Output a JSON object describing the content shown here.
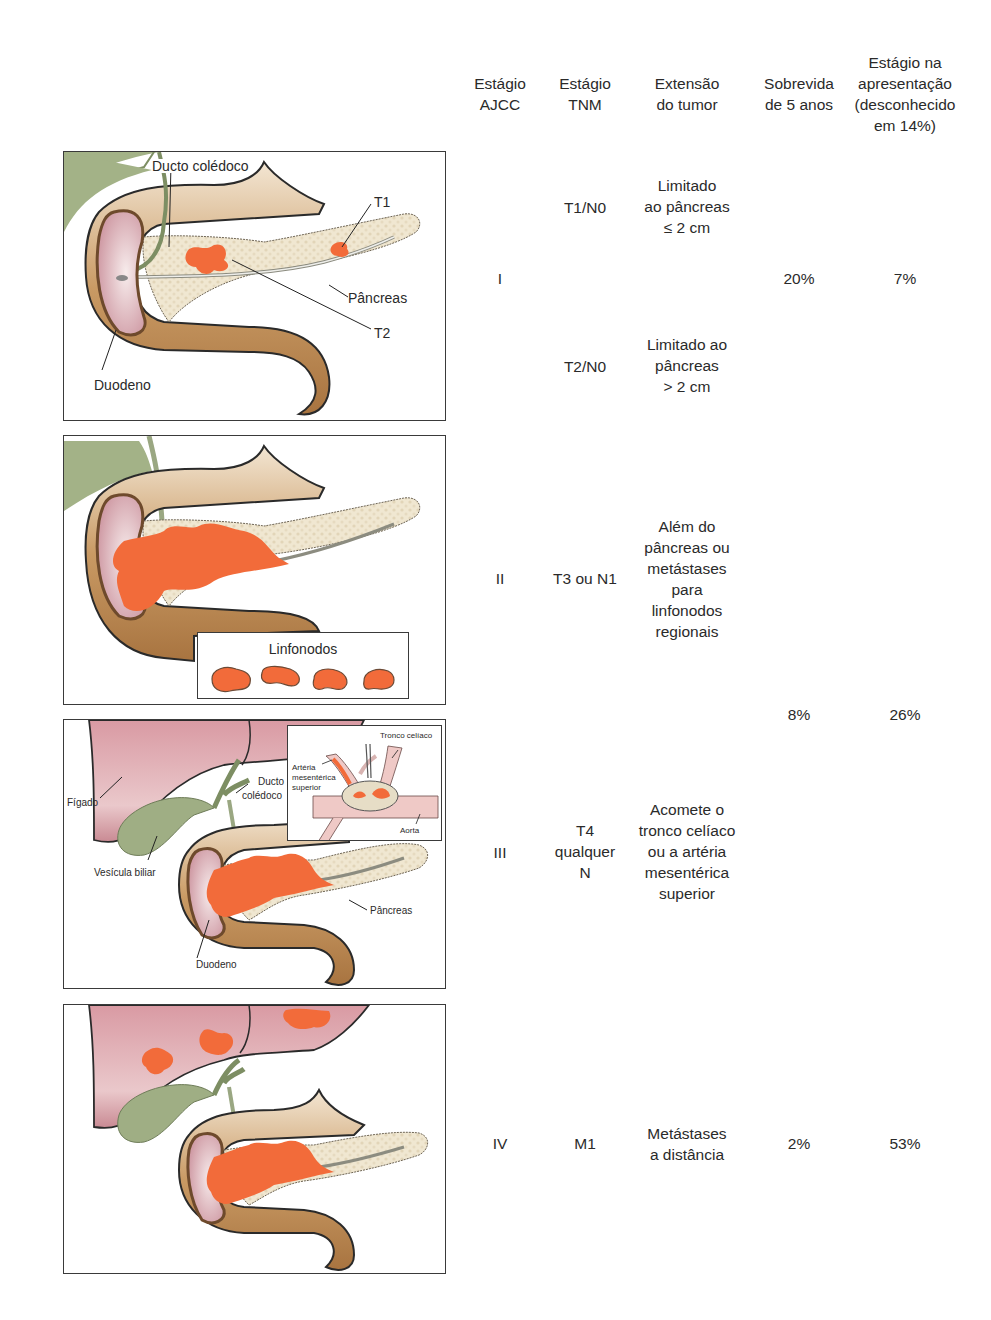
{
  "header": {
    "col_ajcc": [
      "Estágio",
      "AJCC"
    ],
    "col_tnm": [
      "Estágio",
      "TNM"
    ],
    "col_extent": [
      "Extensão",
      "do tumor"
    ],
    "col_survival": [
      "Sobrevida",
      "de 5 anos"
    ],
    "col_presentation": [
      "Estágio na",
      "apresentação",
      "(desconhecido",
      "em 14%)"
    ]
  },
  "rows": [
    {
      "ajcc": "I",
      "substages": [
        {
          "tnm": "T1/N0",
          "extent": [
            "Limitado",
            "ao pâncreas",
            "≤ 2 cm"
          ]
        },
        {
          "tnm": "T2/N0",
          "extent": [
            "Limitado ao",
            "pâncreas",
            "> 2 cm"
          ]
        }
      ],
      "survival": "20%",
      "presentation": "7%"
    },
    {
      "ajcc": "II",
      "tnm": "T3 ou N1",
      "extent": [
        "Além do",
        "pâncreas ou",
        "metástases",
        "para",
        "linfonodos",
        "regionais"
      ]
    },
    {
      "ajcc": "III",
      "tnm": [
        "T4",
        "qualquer",
        "N"
      ],
      "extent": [
        "Acomete o",
        "tronco celíaco",
        "ou a artéria",
        "mesentérica",
        "superior"
      ]
    },
    {
      "ajcc": "IV",
      "tnm": "M1",
      "extent": [
        "Metástases",
        "a distância"
      ],
      "survival": "2%",
      "presentation": "53%"
    }
  ],
  "stage_2_3_shared": {
    "survival": "8%",
    "presentation": "26%"
  },
  "panels": {
    "stage1": {
      "labels": {
        "ducto": "Ducto colédoco",
        "t1": "T1",
        "pancreas": "Pâncreas",
        "t2": "T2",
        "duodeno": "Duodeno"
      }
    },
    "stage2": {
      "labels": {
        "linfonodos": "Linfonodos"
      }
    },
    "stage3": {
      "labels": {
        "figado": "Fígado",
        "ducto1": "Ducto",
        "ducto2": "colédoco",
        "vesicula": "Vesícula biliar",
        "pancreas": "Pâncreas",
        "duodeno": "Duodeno",
        "tronco": "Tronco celíaco",
        "arteria1": "Artéria",
        "arteria2": "mesentérica",
        "arteria3": "superior",
        "aorta": "Aorta"
      }
    },
    "stage4": {
      "labels": {}
    }
  },
  "colors": {
    "tumor": "#f26b3a",
    "duodenum": "#b8864e",
    "duodenum_light": "#e8d2b4",
    "pancreas": "#efe6cf",
    "mucosa": "#d9a9b0",
    "liver": "#d9a7ad",
    "gallbladder": "#9fae84",
    "outline": "#2a2a2a"
  }
}
